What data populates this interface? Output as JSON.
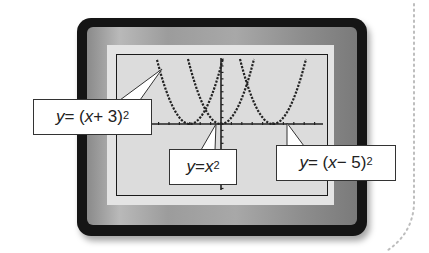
{
  "figure": {
    "colors": {
      "device": "#151515",
      "bezel": "#9c9c9c",
      "frame": "#e4e4e4",
      "screen": "#dcdcdc",
      "plot_ink": "#222222",
      "callout_bg": "#ffffff"
    }
  },
  "callouts": [
    {
      "id": "left",
      "prefix": "y",
      "eq": " = (",
      "var": "x",
      "rest": " + 3)",
      "exp": "2",
      "full": "y = (x + 3)^2"
    },
    {
      "id": "center",
      "prefix": "y",
      "eq": " = ",
      "var": "x",
      "rest": "",
      "exp": "2",
      "full": "y = x^2"
    },
    {
      "id": "right",
      "prefix": "y",
      "eq": " = (",
      "var": "x",
      "rest": " − 5)",
      "exp": "2",
      "full": "y = (x − 5)^2"
    }
  ],
  "chart_data": {
    "type": "line",
    "title": "",
    "xlabel": "",
    "ylabel": "",
    "series": [
      {
        "name": "y = (x + 3)^2",
        "vertex": [
          -3,
          0
        ]
      },
      {
        "name": "y = x^2",
        "vertex": [
          0,
          0
        ]
      },
      {
        "name": "y = (x − 5)^2",
        "vertex": [
          5,
          0
        ]
      }
    ],
    "xlim": [
      -10,
      10
    ],
    "ylim": [
      -10,
      10
    ],
    "tick_spacing": 1,
    "grid": false,
    "legend": "callout labels"
  }
}
